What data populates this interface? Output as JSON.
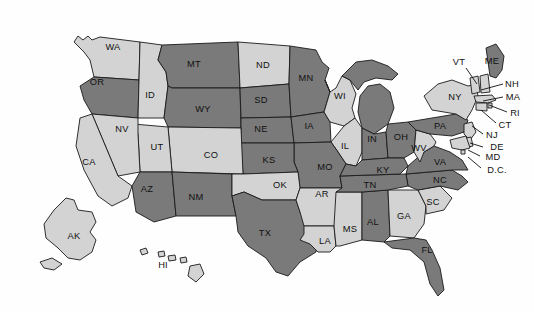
{
  "map": {
    "title": "United States choropleth map",
    "projection": "albers-usa",
    "background_color": "#fefefe",
    "border_color": "#1a1a1a",
    "label_color": "#111111",
    "categories": [
      {
        "key": "dark",
        "color": "#7a7a7a"
      },
      {
        "key": "light",
        "color": "#d3d3d3"
      }
    ],
    "states": [
      {
        "code": "WA",
        "label": "WA",
        "category": "light",
        "lx": 113,
        "ly": 47,
        "leader": null
      },
      {
        "code": "OR",
        "label": "OR",
        "category": "dark",
        "lx": 97,
        "ly": 82,
        "leader": null
      },
      {
        "code": "ID",
        "label": "ID",
        "category": "light",
        "lx": 150,
        "ly": 95,
        "leader": null
      },
      {
        "code": "MT",
        "label": "MT",
        "category": "dark",
        "lx": 194,
        "ly": 64,
        "leader": null
      },
      {
        "code": "WY",
        "label": "WY",
        "category": "dark",
        "lx": 203,
        "ly": 109,
        "leader": null
      },
      {
        "code": "ND",
        "label": "ND",
        "category": "light",
        "lx": 263,
        "ly": 65,
        "leader": null
      },
      {
        "code": "SD",
        "label": "SD",
        "category": "dark",
        "lx": 261,
        "ly": 100,
        "leader": null
      },
      {
        "code": "NE",
        "label": "NE",
        "category": "dark",
        "lx": 261,
        "ly": 129,
        "leader": null
      },
      {
        "code": "MN",
        "label": "MN",
        "category": "dark",
        "lx": 306,
        "ly": 78,
        "leader": null
      },
      {
        "code": "IA",
        "label": "IA",
        "category": "dark",
        "lx": 309,
        "ly": 126,
        "leader": null
      },
      {
        "code": "WI",
        "label": "WI",
        "category": "light",
        "lx": 340,
        "ly": 96,
        "leader": null
      },
      {
        "code": "MI",
        "label": "",
        "category": "dark",
        "lx": 0,
        "ly": 0,
        "leader": null
      },
      {
        "code": "IL",
        "label": "IL",
        "category": "light",
        "lx": 345,
        "ly": 146,
        "leader": null
      },
      {
        "code": "IN",
        "label": "IN",
        "category": "dark",
        "lx": 372,
        "ly": 139,
        "leader": null
      },
      {
        "code": "OH",
        "label": "OH",
        "category": "dark",
        "lx": 401,
        "ly": 137,
        "leader": null
      },
      {
        "code": "MO",
        "label": "MO",
        "category": "dark",
        "lx": 325,
        "ly": 167,
        "leader": null
      },
      {
        "code": "KS",
        "label": "KS",
        "category": "dark",
        "lx": 269,
        "ly": 160,
        "leader": null
      },
      {
        "code": "CO",
        "label": "CO",
        "category": "light",
        "lx": 211,
        "ly": 155,
        "leader": null
      },
      {
        "code": "UT",
        "label": "UT",
        "category": "light",
        "lx": 157,
        "ly": 147,
        "leader": null
      },
      {
        "code": "NV",
        "label": "NV",
        "category": "light",
        "lx": 122,
        "ly": 129,
        "leader": null
      },
      {
        "code": "CA",
        "label": "CA",
        "category": "light",
        "lx": 89,
        "ly": 162,
        "leader": null
      },
      {
        "code": "AZ",
        "label": "AZ",
        "category": "dark",
        "lx": 147,
        "ly": 189,
        "leader": null
      },
      {
        "code": "NM",
        "label": "NM",
        "category": "dark",
        "lx": 196,
        "ly": 197,
        "leader": null
      },
      {
        "code": "OK",
        "label": "OK",
        "category": "light",
        "lx": 280,
        "ly": 185,
        "leader": null
      },
      {
        "code": "TX",
        "label": "TX",
        "category": "dark",
        "lx": 265,
        "ly": 233,
        "leader": null
      },
      {
        "code": "AR",
        "label": "AR",
        "category": "light",
        "lx": 322,
        "ly": 194,
        "leader": null
      },
      {
        "code": "LA",
        "label": "LA",
        "category": "light",
        "lx": 325,
        "ly": 241,
        "leader": null
      },
      {
        "code": "MS",
        "label": "MS",
        "category": "light",
        "lx": 350,
        "ly": 229,
        "leader": null
      },
      {
        "code": "AL",
        "label": "AL",
        "category": "dark",
        "lx": 373,
        "ly": 222,
        "leader": null
      },
      {
        "code": "GA",
        "label": "GA",
        "category": "light",
        "lx": 404,
        "ly": 216,
        "leader": null
      },
      {
        "code": "FL",
        "label": "FL",
        "category": "dark",
        "lx": 427,
        "ly": 250,
        "leader": null
      },
      {
        "code": "SC",
        "label": "SC",
        "category": "light",
        "lx": 433,
        "ly": 202,
        "leader": null
      },
      {
        "code": "NC",
        "label": "NC",
        "category": "dark",
        "lx": 440,
        "ly": 180,
        "leader": null
      },
      {
        "code": "TN",
        "label": "TN",
        "category": "dark",
        "lx": 370,
        "ly": 185,
        "leader": null
      },
      {
        "code": "KY",
        "label": "KY",
        "category": "dark",
        "lx": 383,
        "ly": 170,
        "leader": null
      },
      {
        "code": "VA",
        "label": "VA",
        "category": "dark",
        "lx": 440,
        "ly": 162,
        "leader": null
      },
      {
        "code": "WV",
        "label": "WV",
        "category": "light",
        "lx": 419,
        "ly": 148,
        "leader": null
      },
      {
        "code": "PA",
        "label": "PA",
        "category": "dark",
        "lx": 440,
        "ly": 126,
        "leader": null
      },
      {
        "code": "NY",
        "label": "NY",
        "category": "light",
        "lx": 455,
        "ly": 97,
        "leader": null
      },
      {
        "code": "VT",
        "label": "VT",
        "category": "light",
        "lx": 459,
        "ly": 62,
        "leader": [
          [
            466,
            68
          ],
          [
            477,
            84
          ]
        ]
      },
      {
        "code": "ME",
        "label": "ME",
        "category": "dark",
        "lx": 492,
        "ly": 61,
        "leader": null
      },
      {
        "code": "NH",
        "label": "NH",
        "category": "light",
        "lx": 512,
        "ly": 84,
        "leader": [
          [
            503,
            84
          ],
          [
            481,
            90
          ]
        ]
      },
      {
        "code": "MA",
        "label": "MA",
        "category": "light",
        "lx": 513,
        "ly": 97,
        "leader": [
          [
            503,
            97
          ],
          [
            483,
            101
          ]
        ]
      },
      {
        "code": "RI",
        "label": "RI",
        "category": "light",
        "lx": 515,
        "ly": 113,
        "leader": [
          [
            507,
            112
          ],
          [
            489,
            105
          ]
        ]
      },
      {
        "code": "CT",
        "label": "CT",
        "category": "light",
        "lx": 505,
        "ly": 125,
        "leader": [
          [
            496,
            123
          ],
          [
            481,
            110
          ]
        ]
      },
      {
        "code": "NJ",
        "label": "NJ",
        "category": "light",
        "lx": 492,
        "ly": 135,
        "leader": [
          [
            483,
            134
          ],
          [
            472,
            126
          ]
        ]
      },
      {
        "code": "DE",
        "label": "DE",
        "category": "light",
        "lx": 497,
        "ly": 147,
        "leader": [
          [
            483,
            147
          ],
          [
            470,
            143
          ]
        ]
      },
      {
        "code": "MD",
        "label": "MD",
        "category": "light",
        "lx": 493,
        "ly": 157,
        "leader": [
          [
            480,
            156
          ],
          [
            468,
            150
          ]
        ]
      },
      {
        "code": "D.C.",
        "label": "D.C.",
        "category": "light",
        "lx": 497,
        "ly": 170,
        "leader": [
          [
            481,
            168
          ],
          [
            468,
            157
          ]
        ]
      },
      {
        "code": "AK",
        "label": "AK",
        "category": "light",
        "lx": 74,
        "ly": 236,
        "leader": null
      },
      {
        "code": "HI",
        "label": "HI",
        "category": "light",
        "lx": 163,
        "ly": 265,
        "leader": null
      }
    ]
  }
}
